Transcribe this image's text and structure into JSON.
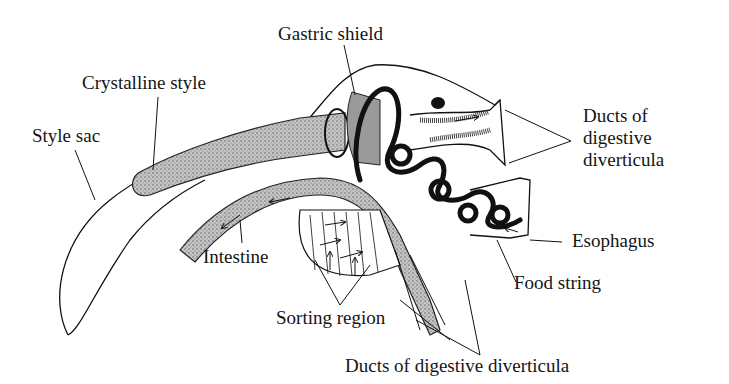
{
  "figure": {
    "background": "#ffffff",
    "ink_color": "#111111",
    "stipple_fill": "#b8b8b8",
    "dark_fill": "#2a2a2a"
  },
  "labels": {
    "gastric_shield": "Gastric shield",
    "crystalline_style": "Crystalline style",
    "style_sac": "Style sac",
    "ducts_right": [
      "Ducts of",
      "digestive",
      "diverticula"
    ],
    "esophagus": "Esophagus",
    "intestine": "Intestine",
    "food_string": "Food string",
    "sorting_region": "Sorting region",
    "ducts_bottom": "Ducts of digestive diverticula"
  }
}
